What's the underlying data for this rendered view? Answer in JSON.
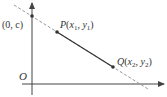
{
  "diagram": {
    "origin_label": "O",
    "intercept_label": "(0, c)",
    "point_p": {
      "name": "P",
      "x_label": "x",
      "x_sub": "1",
      "y_label": "y",
      "y_sub": "1"
    },
    "point_q": {
      "name": "Q",
      "x_label": "x",
      "x_sub": "2",
      "y_label": "y",
      "y_sub": "2"
    },
    "colors": {
      "line": "#333333",
      "dashed": "#888888",
      "point": "#333333"
    }
  }
}
